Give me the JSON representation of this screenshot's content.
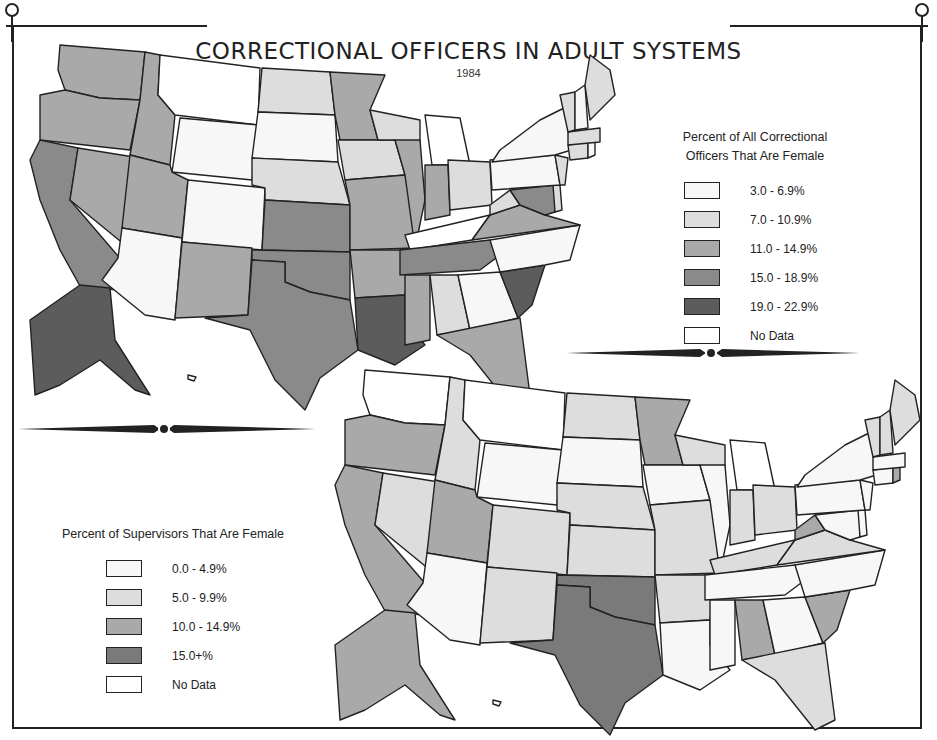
{
  "title": "CORRECTIONAL OFFICERS IN ADULT SYSTEMS",
  "year": "1984",
  "colors": {
    "c0": "#f7f7f7",
    "c1": "#dddddd",
    "c2": "#a9a9a9",
    "c3": "#8a8a8a",
    "c4": "#5c5c5c",
    "nodata": "#ffffff",
    "ink": "#222222"
  },
  "legend_officers": {
    "title_line1": "Percent of All Correctional",
    "title_line2": "Officers That Are Female",
    "items": [
      {
        "label": "3.0 -   6.9%",
        "color": "#f7f7f7"
      },
      {
        "label": "7.0 - 10.9%",
        "color": "#dddddd"
      },
      {
        "label": "11.0 - 14.9%",
        "color": "#a9a9a9"
      },
      {
        "label": "15.0 - 18.9%",
        "color": "#8a8a8a"
      },
      {
        "label": "19.0 - 22.9%",
        "color": "#5c5c5c"
      },
      {
        "label": "No Data",
        "color": "#ffffff"
      }
    ]
  },
  "legend_supervisors": {
    "title": "Percent of Supervisors That Are Female",
    "items": [
      {
        "label": "0.0 -   4.9%",
        "color": "#f7f7f7"
      },
      {
        "label": "5.0 -   9.9%",
        "color": "#dddddd"
      },
      {
        "label": "10.0 - 14.9%",
        "color": "#a9a9a9"
      },
      {
        "label": "15.0+%",
        "color": "#7a7a7a"
      },
      {
        "label": "No Data",
        "color": "#ffffff"
      }
    ]
  },
  "chart_data": [
    {
      "type": "choropleth",
      "title": "Percent of All Correctional Officers That Are Female",
      "year": "1984",
      "categories": [
        "3.0-6.9%",
        "7.0-10.9%",
        "11.0-14.9%",
        "15.0-18.9%",
        "19.0-22.9%",
        "No Data"
      ],
      "states": {
        "WA": "11.0-14.9%",
        "OR": "11.0-14.9%",
        "CA": "15.0-18.9%",
        "NV": "11.0-14.9%",
        "ID": "11.0-14.9%",
        "MT": "No Data",
        "WY": "3.0-6.9%",
        "UT": "11.0-14.9%",
        "AZ": "3.0-6.9%",
        "CO": "3.0-6.9%",
        "NM": "11.0-14.9%",
        "ND": "7.0-10.9%",
        "SD": "3.0-6.9%",
        "NE": "7.0-10.9%",
        "KS": "15.0-18.9%",
        "OK": "15.0-18.9%",
        "TX": "15.0-18.9%",
        "MN": "11.0-14.9%",
        "IA": "7.0-10.9%",
        "MO": "11.0-14.9%",
        "AR": "11.0-14.9%",
        "LA": "19.0-22.9%",
        "WI": "7.0-10.9%",
        "IL": "11.0-14.9%",
        "MI": "No Data",
        "IN": "11.0-14.9%",
        "OH": "7.0-10.9%",
        "KY": "No Data",
        "TN": "15.0-18.9%",
        "MS": "11.0-14.9%",
        "AL": "7.0-10.9%",
        "GA": "3.0-6.9%",
        "FL": "11.0-14.9%",
        "SC": "19.0-22.9%",
        "NC": "3.0-6.9%",
        "VA": "11.0-14.9%",
        "WV": "7.0-10.9%",
        "MD": "15.0-18.9%",
        "DE": "7.0-10.9%",
        "PA": "3.0-6.9%",
        "NJ": "7.0-10.9%",
        "NY": "3.0-6.9%",
        "CT": "7.0-10.9%",
        "RI": "3.0-6.9%",
        "MA": "7.0-10.9%",
        "VT": "7.0-10.9%",
        "NH": "3.0-6.9%",
        "ME": "7.0-10.9%",
        "AK": "19.0-22.9%",
        "HI": "No Data"
      }
    },
    {
      "type": "choropleth",
      "title": "Percent of Supervisors That Are Female",
      "year": "1984",
      "categories": [
        "0.0-4.9%",
        "5.0-9.9%",
        "10.0-14.9%",
        "15.0+%",
        "No Data"
      ],
      "states": {
        "WA": "No Data",
        "OR": "10.0-14.9%",
        "CA": "10.0-14.9%",
        "NV": "5.0-9.9%",
        "ID": "5.0-9.9%",
        "MT": "No Data",
        "WY": "0.0-4.9%",
        "UT": "10.0-14.9%",
        "AZ": "0.0-4.9%",
        "CO": "5.0-9.9%",
        "NM": "5.0-9.9%",
        "ND": "5.0-9.9%",
        "SD": "0.0-4.9%",
        "NE": "5.0-9.9%",
        "KS": "5.0-9.9%",
        "OK": "15.0+%",
        "TX": "15.0+%",
        "MN": "10.0-14.9%",
        "IA": "0.0-4.9%",
        "MO": "5.0-9.9%",
        "AR": "5.0-9.9%",
        "LA": "0.0-4.9%",
        "WI": "5.0-9.9%",
        "IL": "0.0-4.9%",
        "MI": "No Data",
        "IN": "5.0-9.9%",
        "OH": "5.0-9.9%",
        "KY": "5.0-9.9%",
        "TN": "0.0-4.9%",
        "MS": "0.0-4.9%",
        "AL": "10.0-14.9%",
        "GA": "0.0-4.9%",
        "FL": "5.0-9.9%",
        "SC": "10.0-14.9%",
        "NC": "0.0-4.9%",
        "VA": "5.0-9.9%",
        "WV": "10.0-14.9%",
        "MD": "0.0-4.9%",
        "DE": "0.0-4.9%",
        "PA": "0.0-4.9%",
        "NJ": "0.0-4.9%",
        "NY": "0.0-4.9%",
        "CT": "0.0-4.9%",
        "RI": "10.0-14.9%",
        "MA": "0.0-4.9%",
        "VT": "5.0-9.9%",
        "NH": "5.0-9.9%",
        "ME": "5.0-9.9%",
        "AK": "10.0-14.9%",
        "HI": "No Data"
      }
    }
  ]
}
